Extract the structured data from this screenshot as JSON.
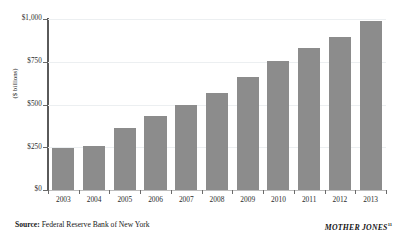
{
  "chart_data": {
    "type": "bar",
    "title": "",
    "subtitle": "",
    "xlabel": "",
    "ylabel": "($ billions)",
    "categories": [
      "2003",
      "2004",
      "2005",
      "2006",
      "2007",
      "2008",
      "2009",
      "2010",
      "2011",
      "2012",
      "2013"
    ],
    "values": [
      245,
      255,
      360,
      435,
      500,
      570,
      660,
      755,
      830,
      895,
      990
    ],
    "ylim": [
      0,
      1000
    ],
    "yticks": [
      0,
      250,
      500,
      750,
      1000
    ],
    "ytick_labels": [
      "$0",
      "$250",
      "$500",
      "$750",
      "$1,000"
    ],
    "grid": true,
    "grid_axis": "y",
    "legend": false,
    "bar_color": "#8c8c8c",
    "gridline_color": "#eceff1",
    "axis_color": "#5a5a5a",
    "background_color": "#ffffff"
  },
  "footer": {
    "source_label": "Source:",
    "source_text": " Federal Reserve Bank of New York",
    "attribution": "MOTHER JONES",
    "footnote_marker": "11"
  }
}
